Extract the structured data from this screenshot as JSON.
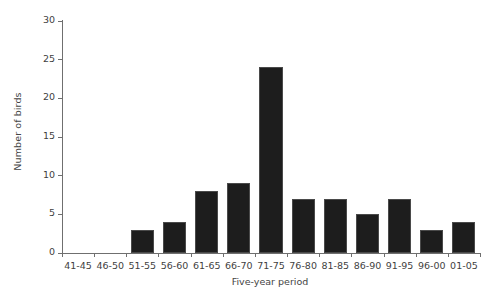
{
  "chart_data": {
    "type": "bar",
    "title": "",
    "xlabel": "Five-year period",
    "ylabel": "Number of birds",
    "categories": [
      "41-45",
      "46-50",
      "51-55",
      "56-60",
      "61-65",
      "66-70",
      "71-75",
      "76-80",
      "81-85",
      "86-90",
      "91-95",
      "96-00",
      "01-05"
    ],
    "values": [
      0,
      0,
      3,
      4,
      8,
      9,
      24,
      7,
      7,
      5,
      7,
      3,
      4
    ],
    "ylim": [
      0,
      30
    ],
    "yticks": [
      0,
      5,
      10,
      15,
      20,
      25,
      30
    ],
    "ytick_labels": [
      "0",
      "5",
      "10",
      "15",
      "20",
      "25",
      "30"
    ],
    "grid": false,
    "legend": false,
    "bar_color": "#1d1d1d",
    "axis_color": "#6f6f6f",
    "text_color": "#3f3f3f",
    "background": "#ffffff"
  }
}
